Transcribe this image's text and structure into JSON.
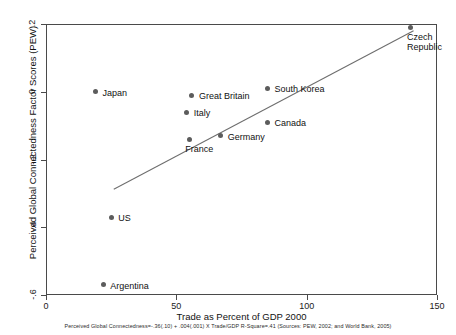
{
  "chart_data": {
    "type": "scatter",
    "title": "",
    "xlabel": "Trade as Percent of GDP 2000",
    "ylabel": "Perceived Global Connectedness Factor Scores (PEW)",
    "xlim": [
      0,
      150
    ],
    "ylim": [
      -0.6,
      0.2
    ],
    "xticks": [
      0,
      50,
      100,
      150
    ],
    "xtick_labels": [
      "0",
      "50",
      "100",
      "150"
    ],
    "yticks": [
      0.2,
      0,
      -0.2,
      -0.4,
      -0.6
    ],
    "ytick_labels": [
      ".2",
      "0",
      "-.2",
      "-.4",
      "-.6"
    ],
    "grid": false,
    "legend": "none",
    "point_color": "#5c5c5c",
    "line_color": "#6e6e6e",
    "axis_color": "#4a4a4a",
    "points": [
      {
        "label": "Japan",
        "x": 19,
        "y": 0.0,
        "label_dx": 7,
        "label_dy": -4
      },
      {
        "label": "Great Britain",
        "x": 56,
        "y": -0.01,
        "label_dx": 7,
        "label_dy": -4
      },
      {
        "label": "Italy",
        "x": 54,
        "y": -0.06,
        "label_dx": 7,
        "label_dy": -4
      },
      {
        "label": "South Korea",
        "x": 85,
        "y": 0.01,
        "label_dx": 7,
        "label_dy": -4
      },
      {
        "label": "Canada",
        "x": 85,
        "y": -0.09,
        "label_dx": 7,
        "label_dy": -4
      },
      {
        "label": "France",
        "x": 55,
        "y": -0.14,
        "label_dx": -4,
        "label_dy": 5
      },
      {
        "label": "Germany",
        "x": 67,
        "y": -0.13,
        "label_dx": 7,
        "label_dy": -4
      },
      {
        "label": "US",
        "x": 25,
        "y": -0.37,
        "label_dx": 7,
        "label_dy": -4
      },
      {
        "label": "Argentina",
        "x": 22,
        "y": -0.57,
        "label_dx": 7,
        "label_dy": -4
      },
      {
        "label": "Czech\nRepublic",
        "x": 140,
        "y": 0.19,
        "label_dx": -4,
        "label_dy": 5
      }
    ],
    "fit_line": {
      "x_start": 26,
      "y_start": -0.288,
      "x_end": 141,
      "y_end": 0.18,
      "intercept": -0.36,
      "slope": 0.004,
      "r_square": 0.41
    },
    "annotation": "Perceived Global Connectedness=-.36(.10) + .004(.001) X Trade/GDP R-Square=.41 (Sources: PEW, 2002; and World Bank, 2005)"
  }
}
